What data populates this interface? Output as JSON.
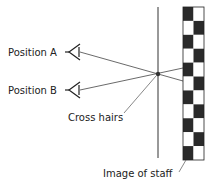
{
  "diagram": {
    "labels": {
      "position_a": "Position A",
      "position_b": "Position B",
      "cross_hairs": "Cross hairs",
      "staff": "Image of staff"
    },
    "staff": {
      "rows": 11,
      "columns": 2,
      "dark_color": "#2a2a2a",
      "light_color": "#ffffff"
    },
    "line_color": "#333333"
  }
}
